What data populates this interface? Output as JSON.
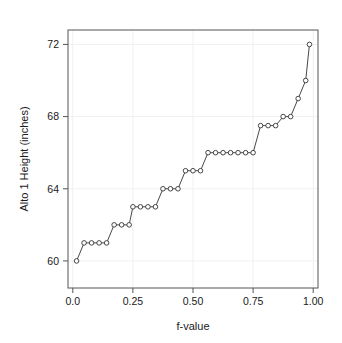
{
  "chart_data": {
    "type": "scatter",
    "title": "",
    "xlabel": "f-value",
    "ylabel": "Alto 1 Height (inches)",
    "xlim": [
      -0.02,
      1.02
    ],
    "ylim": [
      58.5,
      72.8
    ],
    "xticks": [
      0.0,
      0.25,
      0.5,
      0.75,
      1.0
    ],
    "xticklabels": [
      "0.0",
      "0.25",
      "0.50",
      "0.75",
      "1.00"
    ],
    "yticks": [
      60,
      64,
      68,
      72
    ],
    "yticklabels": [
      "60",
      "68",
      "64",
      "72"
    ],
    "grid": true,
    "legend": null,
    "marker": "open-circle",
    "line_connected": true,
    "x": [
      0.0156,
      0.0469,
      0.0781,
      0.1094,
      0.1406,
      0.1719,
      0.2031,
      0.2344,
      0.2656,
      0.2969,
      0.3281,
      0.3594,
      0.3906,
      0.4219,
      0.4531,
      0.4844,
      0.5156,
      0.5469,
      0.5781,
      0.6094,
      0.6406,
      0.6719,
      0.7031,
      0.7344,
      0.7656,
      0.7969,
      0.8281,
      0.8594,
      0.8906,
      0.9219,
      0.9531,
      0.9844
    ],
    "y": [
      60,
      61,
      61,
      61,
      61,
      62,
      62,
      62,
      63,
      63,
      63,
      63,
      64,
      64,
      64,
      65,
      65,
      65,
      65,
      66,
      66,
      66,
      66,
      66,
      66,
      66,
      66,
      67.5,
      67.5,
      67.5,
      68,
      68
    ],
    "y_actual": [
      60,
      61,
      61,
      61,
      61,
      62,
      62,
      62,
      63,
      63,
      63,
      63,
      64,
      64,
      64,
      65,
      65,
      65,
      65,
      66,
      66,
      66,
      66,
      66,
      66,
      66,
      66,
      67.5,
      67.5,
      67.5,
      68,
      68
    ],
    "points": [
      {
        "f": 0.0156,
        "height": 60
      },
      {
        "f": 0.0469,
        "height": 61
      },
      {
        "f": 0.0781,
        "height": 61
      },
      {
        "f": 0.1094,
        "height": 61
      },
      {
        "f": 0.1406,
        "height": 61
      },
      {
        "f": 0.1719,
        "height": 62
      },
      {
        "f": 0.2031,
        "height": 62
      },
      {
        "f": 0.2344,
        "height": 62
      },
      {
        "f": 0.25,
        "height": 63
      },
      {
        "f": 0.2812,
        "height": 63
      },
      {
        "f": 0.3125,
        "height": 63
      },
      {
        "f": 0.3438,
        "height": 63
      },
      {
        "f": 0.375,
        "height": 64
      },
      {
        "f": 0.4062,
        "height": 64
      },
      {
        "f": 0.4375,
        "height": 64
      },
      {
        "f": 0.4688,
        "height": 65
      },
      {
        "f": 0.5,
        "height": 65
      },
      {
        "f": 0.5312,
        "height": 65
      },
      {
        "f": 0.5625,
        "height": 66
      },
      {
        "f": 0.5938,
        "height": 66
      },
      {
        "f": 0.625,
        "height": 66
      },
      {
        "f": 0.6562,
        "height": 66
      },
      {
        "f": 0.6875,
        "height": 66
      },
      {
        "f": 0.7188,
        "height": 66
      },
      {
        "f": 0.75,
        "height": 66
      },
      {
        "f": 0.7812,
        "height": 67.5
      },
      {
        "f": 0.8125,
        "height": 67.5
      },
      {
        "f": 0.8438,
        "height": 67.5
      },
      {
        "f": 0.875,
        "height": 68
      },
      {
        "f": 0.9062,
        "height": 68
      },
      {
        "f": 0.9375,
        "height": 69
      },
      {
        "f": 0.9688,
        "height": 70
      },
      {
        "f": 0.9844,
        "height": 72
      }
    ]
  },
  "colors": {
    "background": "#ffffff",
    "axis": "#555555",
    "grid": "#f0f0f0",
    "data": "#333333",
    "text": "#1a1a1a"
  }
}
